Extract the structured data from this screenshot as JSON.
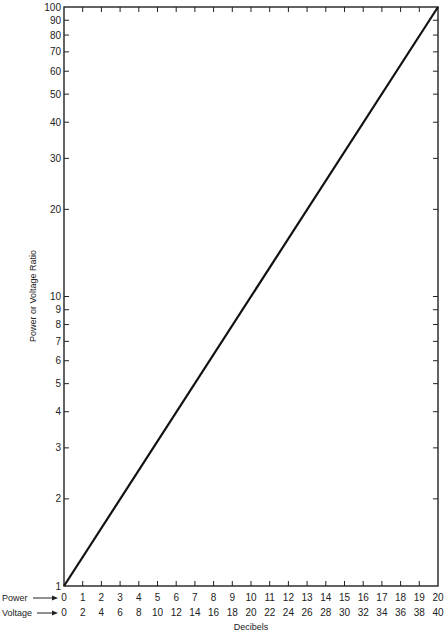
{
  "chart_data": {
    "type": "line",
    "title": "",
    "xlabel": "Decibels",
    "ylabel": "Power or Voltage Ratio",
    "yscale": "log",
    "ylim": [
      1,
      100
    ],
    "xlim_power_db": [
      0,
      20
    ],
    "xlim_voltage_db": [
      0,
      40
    ],
    "grid": false,
    "x_axis_rows": [
      {
        "name": "Power",
        "ticks": [
          "0",
          "1",
          "2",
          "3",
          "4",
          "5",
          "6",
          "7",
          "8",
          "9",
          "10",
          "11",
          "12",
          "13",
          "14",
          "15",
          "16",
          "17",
          "18",
          "19",
          "20"
        ]
      },
      {
        "name": "Voltage",
        "ticks": [
          "0",
          "2",
          "4",
          "6",
          "8",
          "10",
          "12",
          "14",
          "16",
          "18",
          "20",
          "22",
          "24",
          "26",
          "28",
          "30",
          "32",
          "34",
          "36",
          "38",
          "40"
        ]
      }
    ],
    "y_ticks": [
      "1",
      "2",
      "3",
      "4",
      "5",
      "6",
      "7",
      "8",
      "9",
      "10",
      "20",
      "30",
      "40",
      "50",
      "60",
      "70",
      "80",
      "90",
      "100"
    ],
    "series": [
      {
        "name": "Ratio",
        "x_power_db": [
          0,
          20
        ],
        "x_voltage_db": [
          0,
          40
        ],
        "y": [
          1,
          100
        ]
      }
    ]
  },
  "labels": {
    "power_row": "Power",
    "voltage_row": "Voltage",
    "xlabel": "Decibels",
    "ylabel": "Power or Voltage Ratio"
  }
}
